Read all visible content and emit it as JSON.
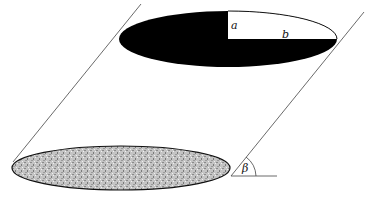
{
  "diagram": {
    "labels": {
      "semi_minor": "a",
      "semi_major": "b",
      "angle": "β"
    },
    "colors": {
      "top_face_fill": "#000000",
      "quadrant_fill": "#ffffff",
      "base_fill": "#b8b8b8",
      "line": "#333333"
    }
  }
}
